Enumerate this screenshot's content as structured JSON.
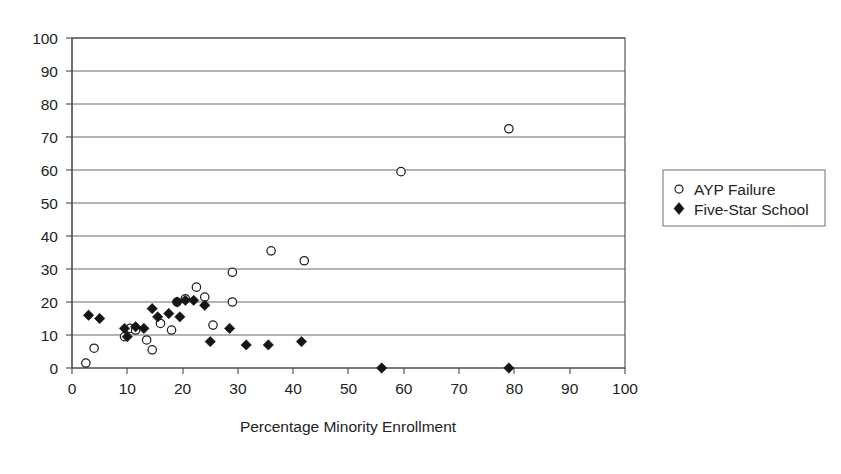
{
  "chart_data": {
    "type": "scatter",
    "title": "",
    "subtitle": "",
    "xlabel": "Percentage Minority Enrollment",
    "ylabel": "",
    "xlim": [
      0,
      100
    ],
    "ylim": [
      0,
      100
    ],
    "xticks": [
      0,
      10,
      20,
      30,
      40,
      50,
      60,
      70,
      80,
      90,
      100
    ],
    "yticks": [
      0,
      10,
      20,
      30,
      40,
      50,
      60,
      70,
      80,
      90,
      100
    ],
    "xtick_labels": [
      "0",
      "10",
      "20",
      "30",
      "40",
      "50",
      "60",
      "70",
      "80",
      "90",
      "100"
    ],
    "ytick_labels": [
      "0",
      "10",
      "20",
      "30",
      "40",
      "50",
      "60",
      "70",
      "80",
      "90",
      "100"
    ],
    "grid": "horizontal",
    "legend_position": "right",
    "series": [
      {
        "name": "AYP Failure",
        "marker": "open-circle",
        "color": "#222222",
        "points": [
          [
            2.5,
            1.5
          ],
          [
            4.0,
            6.0
          ],
          [
            9.5,
            9.5
          ],
          [
            10.5,
            12.0
          ],
          [
            11.5,
            11.5
          ],
          [
            13.5,
            8.5
          ],
          [
            14.5,
            5.5
          ],
          [
            16.0,
            13.5
          ],
          [
            18.0,
            11.5
          ],
          [
            19.0,
            20.0
          ],
          [
            20.5,
            21.0
          ],
          [
            22.5,
            24.5
          ],
          [
            24.0,
            21.5
          ],
          [
            25.5,
            13.0
          ],
          [
            29.0,
            20.0
          ],
          [
            29.0,
            29.0
          ],
          [
            36.0,
            35.5
          ],
          [
            42.0,
            32.5
          ],
          [
            59.5,
            59.5
          ],
          [
            79.0,
            72.5
          ]
        ]
      },
      {
        "name": "Five-Star School",
        "marker": "filled-diamond",
        "color": "#151515",
        "points": [
          [
            3.0,
            16.0
          ],
          [
            5.0,
            15.0
          ],
          [
            9.5,
            12.0
          ],
          [
            10.0,
            9.5
          ],
          [
            11.5,
            12.5
          ],
          [
            13.0,
            12.0
          ],
          [
            14.5,
            18.0
          ],
          [
            15.5,
            15.5
          ],
          [
            17.5,
            16.5
          ],
          [
            19.0,
            20.0
          ],
          [
            19.5,
            15.5
          ],
          [
            20.5,
            20.5
          ],
          [
            22.0,
            20.5
          ],
          [
            24.0,
            19.0
          ],
          [
            25.0,
            8.0
          ],
          [
            28.5,
            12.0
          ],
          [
            31.5,
            7.0
          ],
          [
            35.5,
            7.0
          ],
          [
            41.5,
            8.0
          ],
          [
            56.0,
            0.0
          ],
          [
            79.0,
            0.0
          ]
        ]
      }
    ]
  },
  "legend": {
    "entries": [
      {
        "label": "AYP Failure",
        "marker": "open-circle"
      },
      {
        "label": "Five-Star School",
        "marker": "filled-diamond"
      }
    ]
  },
  "axis": {
    "x_title": "Percentage Minority Enrollment"
  }
}
